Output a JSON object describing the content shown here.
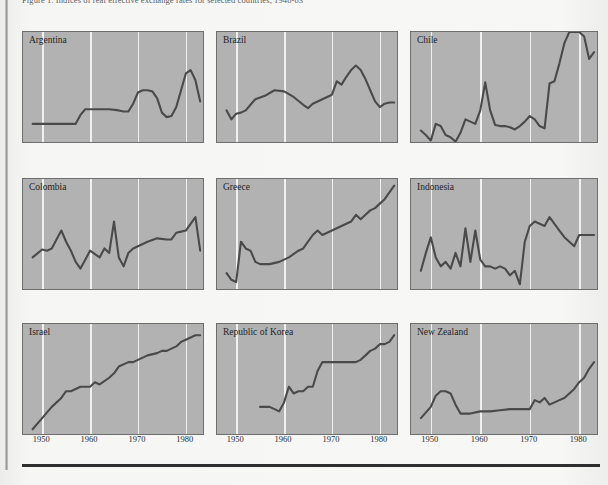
{
  "page": {
    "caption": "Figure 1.  Indices of real effective exchange rates for selected countries, 1948-83",
    "background_color": "#f6f6f5",
    "rule_color": "#2e2e2e"
  },
  "style": {
    "panel_fill": "#b2b2b2",
    "panel_border": "#6e6e6e",
    "gridline_color": "#f0f0ee",
    "line_color": "#4a4a4a"
  },
  "axis": {
    "ticks": [
      "1950",
      "1960",
      "1970",
      "1980"
    ],
    "tick_years": [
      1950,
      1960,
      1970,
      1980
    ],
    "xlim": [
      1946,
      1984
    ]
  },
  "chart_data": {
    "type": "line",
    "title": "Indices of real effective exchange rates for selected countries, 1948-83",
    "xlabel": "",
    "ylabel": "",
    "grid": "vertical",
    "legend": "none",
    "xlim": [
      1946,
      1984
    ],
    "ylim": [
      0,
      100
    ],
    "layout": {
      "rows": 3,
      "cols": 3
    },
    "panels": [
      {
        "name": "Argentina",
        "row": 0,
        "col": 0,
        "x": [
          1948,
          1950,
          1952,
          1954,
          1955,
          1956,
          1957,
          1958,
          1959,
          1960,
          1962,
          1964,
          1966,
          1967,
          1968,
          1969,
          1970,
          1971,
          1972,
          1973,
          1974,
          1975,
          1976,
          1977,
          1978,
          1979,
          1980,
          1981,
          1982,
          1983
        ],
        "y": [
          18,
          18,
          18,
          18,
          18,
          18,
          18,
          26,
          31,
          31,
          31,
          31,
          30,
          29,
          29,
          36,
          46,
          48,
          48,
          47,
          41,
          28,
          24,
          25,
          33,
          48,
          63,
          66,
          57,
          38
        ]
      },
      {
        "name": "Brazil",
        "row": 0,
        "col": 1,
        "x": [
          1948,
          1949,
          1950,
          1951,
          1952,
          1953,
          1954,
          1956,
          1958,
          1960,
          1962,
          1964,
          1965,
          1966,
          1968,
          1970,
          1971,
          1972,
          1973,
          1974,
          1975,
          1976,
          1977,
          1978,
          1979,
          1980,
          1981,
          1982,
          1983
        ],
        "y": [
          30,
          22,
          27,
          28,
          30,
          35,
          40,
          43,
          48,
          47,
          42,
          35,
          32,
          36,
          40,
          44,
          56,
          53,
          60,
          66,
          70,
          66,
          58,
          48,
          38,
          33,
          36,
          37,
          37
        ]
      },
      {
        "name": "Chile",
        "row": 0,
        "col": 2,
        "x": [
          1948,
          1949,
          1950,
          1951,
          1952,
          1953,
          1954,
          1955,
          1956,
          1957,
          1958,
          1959,
          1960,
          1961,
          1962,
          1963,
          1964,
          1965,
          1966,
          1967,
          1968,
          1969,
          1970,
          1971,
          1972,
          1973,
          1974,
          1975,
          1976,
          1977,
          1978,
          1979,
          1980,
          1981,
          1982,
          1983
        ],
        "y": [
          12,
          8,
          3,
          18,
          16,
          8,
          6,
          2,
          10,
          22,
          20,
          18,
          30,
          55,
          30,
          17,
          16,
          16,
          15,
          13,
          16,
          20,
          25,
          22,
          16,
          14,
          54,
          56,
          72,
          90,
          100,
          100,
          100,
          96,
          76,
          82
        ]
      },
      {
        "name": "Colombia",
        "row": 1,
        "col": 0,
        "x": [
          1948,
          1950,
          1951,
          1952,
          1954,
          1955,
          1956,
          1957,
          1958,
          1959,
          1960,
          1962,
          1963,
          1964,
          1965,
          1966,
          1967,
          1968,
          1969,
          1970,
          1972,
          1974,
          1976,
          1977,
          1978,
          1979,
          1980,
          1981,
          1982,
          1983
        ],
        "y": [
          30,
          37,
          36,
          38,
          54,
          44,
          36,
          26,
          20,
          28,
          36,
          30,
          38,
          34,
          62,
          30,
          22,
          34,
          38,
          40,
          44,
          47,
          46,
          46,
          52,
          53,
          54,
          60,
          66,
          36
        ]
      },
      {
        "name": "Greece",
        "row": 1,
        "col": 1,
        "x": [
          1948,
          1949,
          1950,
          1951,
          1952,
          1953,
          1954,
          1955,
          1957,
          1959,
          1961,
          1963,
          1964,
          1965,
          1966,
          1967,
          1968,
          1969,
          1970,
          1971,
          1972,
          1973,
          1974,
          1975,
          1976,
          1977,
          1978,
          1979,
          1980,
          1981,
          1982,
          1983
        ],
        "y": [
          16,
          10,
          8,
          44,
          38,
          36,
          26,
          24,
          24,
          26,
          30,
          36,
          38,
          44,
          50,
          54,
          50,
          52,
          54,
          56,
          58,
          60,
          62,
          68,
          64,
          68,
          72,
          74,
          78,
          82,
          88,
          94
        ]
      },
      {
        "name": "Indonesia",
        "row": 1,
        "col": 2,
        "x": [
          1948,
          1949,
          1950,
          1951,
          1952,
          1953,
          1954,
          1955,
          1956,
          1957,
          1958,
          1959,
          1960,
          1961,
          1962,
          1963,
          1964,
          1965,
          1966,
          1967,
          1968,
          1969,
          1970,
          1971,
          1972,
          1973,
          1974,
          1975,
          1976,
          1977,
          1978,
          1979,
          1980,
          1981,
          1982,
          1983
        ],
        "y": [
          18,
          34,
          48,
          30,
          22,
          26,
          20,
          34,
          22,
          56,
          26,
          54,
          28,
          22,
          22,
          20,
          22,
          20,
          14,
          18,
          6,
          44,
          58,
          62,
          60,
          58,
          66,
          60,
          54,
          48,
          44,
          40,
          50,
          50,
          50,
          50
        ]
      },
      {
        "name": "Israel",
        "row": 2,
        "col": 0,
        "x": [
          1948,
          1950,
          1952,
          1954,
          1955,
          1956,
          1958,
          1960,
          1961,
          1962,
          1964,
          1965,
          1966,
          1968,
          1969,
          1970,
          1971,
          1972,
          1974,
          1975,
          1976,
          1978,
          1979,
          1980,
          1981,
          1982,
          1983
        ],
        "y": [
          6,
          16,
          26,
          34,
          40,
          40,
          44,
          44,
          48,
          46,
          52,
          56,
          62,
          66,
          66,
          68,
          70,
          72,
          74,
          76,
          76,
          80,
          84,
          86,
          88,
          90,
          90
        ]
      },
      {
        "name": "Republic of Korea",
        "row": 2,
        "col": 1,
        "x": [
          1955,
          1956,
          1957,
          1958,
          1959,
          1960,
          1961,
          1962,
          1963,
          1964,
          1965,
          1966,
          1967,
          1968,
          1969,
          1970,
          1972,
          1974,
          1975,
          1976,
          1977,
          1978,
          1979,
          1980,
          1981,
          1982,
          1983
        ],
        "y": [
          26,
          26,
          26,
          24,
          22,
          30,
          44,
          38,
          40,
          40,
          44,
          44,
          58,
          66,
          66,
          66,
          66,
          66,
          66,
          68,
          72,
          76,
          78,
          82,
          82,
          84,
          90
        ]
      },
      {
        "name": "New Zealand",
        "row": 2,
        "col": 2,
        "x": [
          1948,
          1950,
          1951,
          1952,
          1953,
          1954,
          1955,
          1956,
          1957,
          1958,
          1960,
          1962,
          1964,
          1966,
          1968,
          1970,
          1971,
          1972,
          1973,
          1974,
          1975,
          1976,
          1977,
          1978,
          1979,
          1980,
          1981,
          1982,
          1983
        ],
        "y": [
          16,
          26,
          36,
          40,
          40,
          38,
          28,
          20,
          20,
          20,
          22,
          22,
          23,
          24,
          24,
          24,
          32,
          30,
          34,
          28,
          30,
          32,
          34,
          38,
          42,
          48,
          52,
          60,
          66
        ]
      }
    ]
  }
}
